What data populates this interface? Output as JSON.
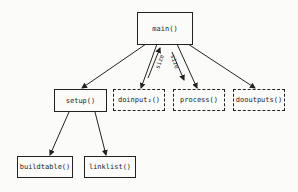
{
  "diagram": {
    "nodes": {
      "main": {
        "label": "main()",
        "style": "solid"
      },
      "setup": {
        "label": "setup()",
        "style": "solid"
      },
      "doinput": {
        "label": "doinput₂()",
        "style": "dashed"
      },
      "process": {
        "label": "process()",
        "style": "dashed"
      },
      "dooutputs": {
        "label": "dooutputs()",
        "style": "dashed"
      },
      "buildtable": {
        "label": "buildtable()",
        "style": "solid"
      },
      "linklist": {
        "label": "linklist()",
        "style": "solid"
      }
    },
    "edges": [
      {
        "from": "main",
        "to": "setup"
      },
      {
        "from": "main",
        "to": "doinput",
        "data_back": "size"
      },
      {
        "from": "main",
        "to": "process",
        "data": "size"
      },
      {
        "from": "main",
        "to": "dooutputs"
      },
      {
        "from": "setup",
        "to": "buildtable"
      },
      {
        "from": "setup",
        "to": "linklist"
      }
    ],
    "edge_labels": {
      "doinput_size": "size",
      "process_size": "size"
    }
  }
}
